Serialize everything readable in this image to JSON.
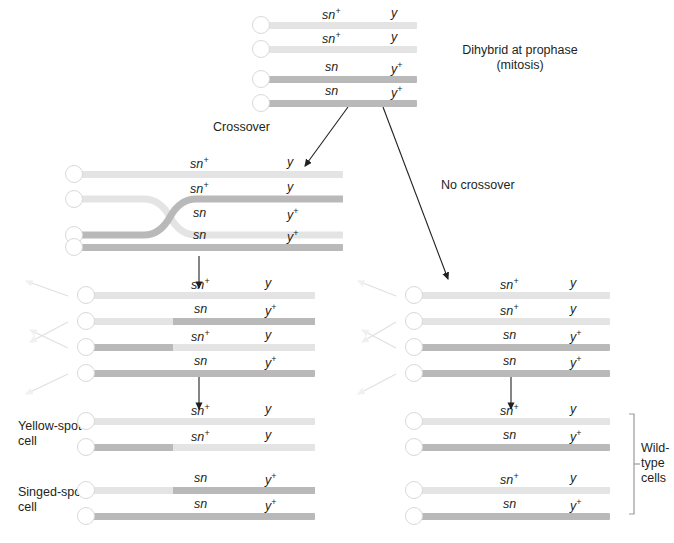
{
  "figure": {
    "type": "diagram"
  },
  "alleles": {
    "sn_plus": "sn",
    "sn_plus_sup": "+",
    "sn": "sn",
    "y": "y",
    "y_plus": "y",
    "y_plus_sup": "+"
  },
  "colors": {
    "light_chromatid": "#e4e4e4",
    "dark_chromatid": "#b9b9b9",
    "centromere_fill": "#ffffff",
    "centromere_stroke": "#d9d9d9",
    "text": "#231f20",
    "arrow": "#231f20",
    "faint_arrow": "#cfcfcf",
    "bracket": "#9a9a9a"
  },
  "captions": {
    "dihybrid": "Dihybrid at prophase\n(mitosis)",
    "crossover": "Crossover",
    "no_crossover": "No crossover",
    "yellow_spot": "Yellow-spot\ncell",
    "singed_spot": "Singed-spot\ncell",
    "wild_type": "Wild-\ntype\ncells"
  },
  "groups": [
    {
      "id": "dihybrid",
      "name": "dihybrid-prophase",
      "chromatids": [
        {
          "sn": "sn+",
          "y": "y",
          "segments": [
            {
              "shade": "light",
              "from": 0,
              "to": 100
            }
          ]
        },
        {
          "sn": "sn+",
          "y": "y",
          "segments": [
            {
              "shade": "light",
              "from": 0,
              "to": 100
            }
          ]
        },
        {
          "sn": "sn",
          "y": "y+",
          "segments": [
            {
              "shade": "dark",
              "from": 0,
              "to": 100
            }
          ]
        },
        {
          "sn": "sn",
          "y": "y+",
          "segments": [
            {
              "shade": "dark",
              "from": 0,
              "to": 100
            }
          ]
        }
      ]
    },
    {
      "id": "crossover-tetrad",
      "name": "crossover-four-strand",
      "chromatids": [
        {
          "sn": "sn+",
          "y": "y",
          "segments": [
            {
              "shade": "light",
              "from": 0,
              "to": 100
            }
          ]
        },
        {
          "sn": "sn+",
          "y": "y",
          "segments": [
            {
              "shade": "light",
              "from": 0,
              "to": 100
            }
          ]
        },
        {
          "sn": "sn",
          "y": "y+",
          "segments": [
            {
              "shade": "dark",
              "from": 0,
              "to": 100
            }
          ]
        },
        {
          "sn": "sn",
          "y": "y+",
          "segments": [
            {
              "shade": "dark",
              "from": 0,
              "to": 100
            }
          ]
        }
      ]
    },
    {
      "id": "left-anaphase",
      "name": "left-recombinant-chromatids",
      "chromatids": [
        {
          "sn": "sn+",
          "y": "y",
          "segments": [
            {
              "shade": "light",
              "from": 0,
              "to": 100
            }
          ]
        },
        {
          "sn": "sn",
          "y": "y+",
          "segments": [
            {
              "shade": "light",
              "from": 0,
              "to": 37
            },
            {
              "shade": "dark",
              "from": 37,
              "to": 100
            }
          ]
        },
        {
          "sn": "sn+",
          "y": "y",
          "segments": [
            {
              "shade": "dark",
              "from": 0,
              "to": 37
            },
            {
              "shade": "light",
              "from": 37,
              "to": 100
            }
          ]
        },
        {
          "sn": "sn",
          "y": "y+",
          "segments": [
            {
              "shade": "dark",
              "from": 0,
              "to": 100
            }
          ]
        }
      ]
    },
    {
      "id": "right-anaphase",
      "name": "right-nonrecombinant-chromatids",
      "chromatids": [
        {
          "sn": "sn+",
          "y": "y",
          "segments": [
            {
              "shade": "light",
              "from": 0,
              "to": 100
            }
          ]
        },
        {
          "sn": "sn+",
          "y": "y",
          "segments": [
            {
              "shade": "light",
              "from": 0,
              "to": 100
            }
          ]
        },
        {
          "sn": "sn",
          "y": "y+",
          "segments": [
            {
              "shade": "dark",
              "from": 0,
              "to": 100
            }
          ]
        },
        {
          "sn": "sn",
          "y": "y+",
          "segments": [
            {
              "shade": "dark",
              "from": 0,
              "to": 100
            }
          ]
        }
      ]
    },
    {
      "id": "yellow-spot",
      "name": "yellow-spot-daughter-cell",
      "chromatids": [
        {
          "sn": "sn+",
          "y": "y",
          "segments": [
            {
              "shade": "light",
              "from": 0,
              "to": 100
            }
          ]
        },
        {
          "sn": "sn+",
          "y": "y",
          "segments": [
            {
              "shade": "dark",
              "from": 0,
              "to": 37
            },
            {
              "shade": "light",
              "from": 37,
              "to": 100
            }
          ]
        }
      ]
    },
    {
      "id": "singed-spot",
      "name": "singed-spot-daughter-cell",
      "chromatids": [
        {
          "sn": "sn",
          "y": "y+",
          "segments": [
            {
              "shade": "light",
              "from": 0,
              "to": 37
            },
            {
              "shade": "dark",
              "from": 37,
              "to": 100
            }
          ]
        },
        {
          "sn": "sn",
          "y": "y+",
          "segments": [
            {
              "shade": "dark",
              "from": 0,
              "to": 100
            }
          ]
        }
      ]
    },
    {
      "id": "wildtype-upper",
      "name": "wild-type-daughter-cell-upper",
      "chromatids": [
        {
          "sn": "sn+",
          "y": "y",
          "segments": [
            {
              "shade": "light",
              "from": 0,
              "to": 100
            }
          ]
        },
        {
          "sn": "sn",
          "y": "y+",
          "segments": [
            {
              "shade": "dark",
              "from": 0,
              "to": 100
            }
          ]
        }
      ]
    },
    {
      "id": "wildtype-lower",
      "name": "wild-type-daughter-cell-lower",
      "chromatids": [
        {
          "sn": "sn+",
          "y": "y",
          "segments": [
            {
              "shade": "light",
              "from": 0,
              "to": 100
            }
          ]
        },
        {
          "sn": "sn",
          "y": "y+",
          "segments": [
            {
              "shade": "dark",
              "from": 0,
              "to": 100
            }
          ]
        }
      ]
    }
  ]
}
